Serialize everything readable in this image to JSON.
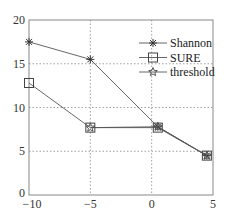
{
  "chart_data": {
    "type": "line",
    "title": "",
    "xlabel": "",
    "ylabel": "",
    "xlim": [
      -10,
      5
    ],
    "ylim": [
      0,
      20
    ],
    "x_ticks": [
      -10,
      -5,
      0,
      5
    ],
    "y_ticks": [
      0,
      5,
      10,
      15,
      20
    ],
    "grid": true,
    "legend_position": "upper right",
    "series": [
      {
        "name": "Shannon",
        "marker": "asterisk",
        "x": [
          -10,
          -5,
          0.5,
          4.5
        ],
        "values": [
          17.5,
          15.5,
          7.8,
          4.5
        ]
      },
      {
        "name": "SURE",
        "marker": "square",
        "x": [
          -10,
          -5,
          0.5,
          4.5
        ],
        "values": [
          12.8,
          7.7,
          7.7,
          4.5
        ]
      },
      {
        "name": "threshold",
        "marker": "star",
        "x": [
          -5,
          0.5,
          4.5
        ],
        "values": [
          7.7,
          7.8,
          4.5
        ]
      }
    ]
  },
  "colors": {
    "line": "#555555",
    "grid": "#888888",
    "axis": "#777777"
  }
}
